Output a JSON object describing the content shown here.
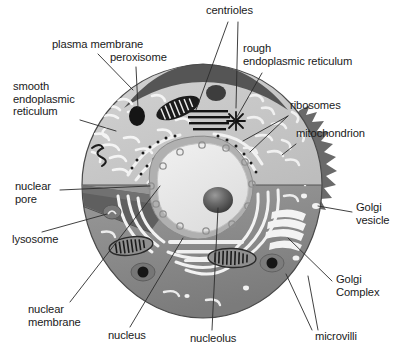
{
  "figure": {
    "background_color": "#ffffff",
    "text_color": "#1a1a1a",
    "leader_line_color": "#2b2b2b"
  },
  "palette": {
    "membrane_cap_dark": "#5e5e5e",
    "upper_cytoplasm_light": "#c9c9c9",
    "lower_cytoplasm_mid": "#8e8e8e",
    "cut_face_dark": "#6f6f6f",
    "cut_wedge_darker": "#5a5a5a",
    "nucleoplasm": "#b4b4b4",
    "nucleus_light": "#e8e8e8",
    "nucleolus_dark": "#4a4a4a",
    "organelle_outline": "#222222",
    "er_white": "#f2f2f2",
    "golgi_white": "#f5f5f5"
  },
  "labels": [
    {
      "id": "centrioles",
      "text": "centrioles",
      "x": 206,
      "y": 8,
      "align": "left"
    },
    {
      "id": "plasma-membrane",
      "text": "plasma membrane",
      "x": 52,
      "y": 41,
      "align": "left"
    },
    {
      "id": "peroxisome",
      "text": "peroxisome",
      "x": 110,
      "y": 53,
      "align": "left"
    },
    {
      "id": "rough-er",
      "text": "rough\nendoplasmic reticulum",
      "x": 243,
      "y": 46,
      "align": "left"
    },
    {
      "id": "smooth-er",
      "text": "smooth\nendoplasmic\nreticulum",
      "x": 13,
      "y": 82,
      "align": "left"
    },
    {
      "id": "ribosomes",
      "text": "ribosomes",
      "x": 290,
      "y": 103,
      "align": "left"
    },
    {
      "id": "mitochondrion",
      "text": "mitochondrion",
      "x": 298,
      "y": 131,
      "align": "left"
    },
    {
      "id": "nuclear-pore",
      "text": "nuclear\npore",
      "x": 15,
      "y": 183,
      "align": "left"
    },
    {
      "id": "golgi-vesicle",
      "text": "Golgi\nvesicle",
      "x": 356,
      "y": 205,
      "align": "left"
    },
    {
      "id": "lysosome",
      "text": "lysosome",
      "x": 12,
      "y": 236,
      "align": "left"
    },
    {
      "id": "golgi-complex",
      "text": "Golgi\nComplex",
      "x": 336,
      "y": 277,
      "align": "left"
    },
    {
      "id": "nuclear-membrane",
      "text": "nuclear\nmembrane",
      "x": 28,
      "y": 307,
      "align": "left"
    },
    {
      "id": "nucleus",
      "text": "nucleus",
      "x": 108,
      "y": 333,
      "align": "left"
    },
    {
      "id": "nucleolus",
      "text": "nucleolus",
      "x": 190,
      "y": 336,
      "align": "left"
    },
    {
      "id": "microvilli",
      "text": "microvilli",
      "x": 315,
      "y": 334,
      "align": "left"
    }
  ],
  "leader_lines": [
    {
      "id": "leader-centrioles-a",
      "from": "centrioles",
      "points": "228,22 192,96"
    },
    {
      "id": "leader-centrioles-b",
      "from": "centrioles",
      "points": "236,22 236,106"
    },
    {
      "id": "leader-plasma-membrane",
      "from": "plasma-membrane",
      "points": "96,53 131,88"
    },
    {
      "id": "leader-peroxisome",
      "from": "peroxisome",
      "points": "135,66 137,114"
    },
    {
      "id": "leader-rough-er",
      "from": "rough-er",
      "points": "262,72 231,123"
    },
    {
      "id": "leader-smooth-er",
      "from": "smooth-er",
      "points": "82,120 116,130"
    },
    {
      "id": "leader-ribosomes",
      "from": "ribosomes",
      "points": "289,115 241,140"
    },
    {
      "id": "leader-mitochondrion",
      "from": "mitochondrion",
      "points": "297,143 279,156"
    },
    {
      "id": "leader-nuclear-pore",
      "from": "nuclear-pore",
      "points": "63,189 151,186"
    },
    {
      "id": "leader-golgi-vesicle",
      "from": "golgi-vesicle",
      "points": "354,212 316,206"
    },
    {
      "id": "leader-lysosome",
      "from": "lysosome",
      "points": "40,232 169,195"
    },
    {
      "id": "leader-golgi-complex",
      "from": "golgi-complex",
      "points": "334,281 290,237"
    },
    {
      "id": "leader-nuclear-membrane",
      "from": "nuclear-membrane",
      "points": "69,302 160,185"
    },
    {
      "id": "leader-nucleus",
      "from": "nucleus",
      "points": "129,327 182,240"
    },
    {
      "id": "leader-nucleolus",
      "from": "nucleolus",
      "points": "212,330 217,203"
    },
    {
      "id": "leader-microvilli-a",
      "from": "microvilli",
      "points": "313,332 288,275"
    },
    {
      "id": "leader-microvilli-b",
      "from": "microvilli",
      "points": "318,332 306,278"
    }
  ],
  "structures": [
    {
      "id": "plasma-membrane",
      "name": "plasma membrane"
    },
    {
      "id": "membrane-cap",
      "name": "cut membrane cap"
    },
    {
      "id": "upper-cytoplasm",
      "name": "upper cytoplasm"
    },
    {
      "id": "lower-cytoplasm",
      "name": "lower cytoplasm cut face"
    },
    {
      "id": "nucleus",
      "name": "nucleus"
    },
    {
      "id": "nucleolus",
      "name": "nucleolus"
    },
    {
      "id": "nuclear-membrane",
      "name": "nuclear membrane"
    },
    {
      "id": "nuclear-pore",
      "name": "nuclear pore"
    },
    {
      "id": "peroxisome",
      "name": "peroxisome"
    },
    {
      "id": "lysosome",
      "name": "lysosome"
    },
    {
      "id": "mitochondrion-1",
      "name": "mitochondrion (upper left)"
    },
    {
      "id": "mitochondrion-2",
      "name": "mitochondrion (right)"
    },
    {
      "id": "mitochondrion-3",
      "name": "mitochondrion (lower left)"
    },
    {
      "id": "mitochondrion-4",
      "name": "mitochondrion (lower center)"
    },
    {
      "id": "centriole-1",
      "name": "centriole striped body"
    },
    {
      "id": "centriole-2",
      "name": "centriole star body"
    },
    {
      "id": "rough-er",
      "name": "rough endoplasmic reticulum"
    },
    {
      "id": "smooth-er",
      "name": "smooth endoplasmic reticulum"
    },
    {
      "id": "ribosomes",
      "name": "ribosomes"
    },
    {
      "id": "golgi-complex",
      "name": "Golgi complex"
    },
    {
      "id": "golgi-vesicle",
      "name": "Golgi vesicle"
    },
    {
      "id": "microvilli",
      "name": "microvilli"
    }
  ]
}
